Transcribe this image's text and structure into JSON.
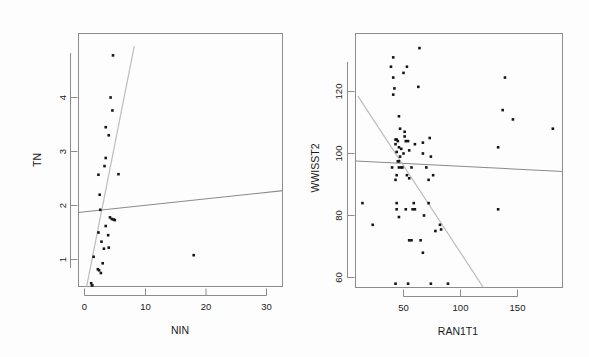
{
  "figure": {
    "title": "",
    "background": "#fdfdfd",
    "point_color": "#161616",
    "axis_color": "#8c8c8c",
    "fit_line_color": "#8a8a8a",
    "steep_line_color": "#bdbdbd"
  },
  "panels": [
    {
      "id": "left",
      "xlabel": "NIN",
      "ylabel": "TN",
      "xticks": [
        "0",
        "10",
        "20",
        "30"
      ],
      "yticks": [
        "1",
        "2",
        "3",
        "4"
      ]
    },
    {
      "id": "right",
      "xlabel": "RAN1T1",
      "ylabel": "WWISST2",
      "xticks": [
        "50",
        "100",
        "150"
      ],
      "yticks": [
        "60",
        "80",
        "100",
        "120"
      ]
    }
  ],
  "chart_data": [
    {
      "type": "scatter",
      "title": "",
      "xlabel": "NIN",
      "ylabel": "TN",
      "xlim": [
        -1.2,
        36.5
      ],
      "ylim": [
        0.3,
        4.95
      ],
      "xticks": [
        0,
        10,
        20,
        30
      ],
      "yticks": [
        1,
        2,
        3,
        4
      ],
      "grid": false,
      "legend": "none",
      "points": [
        {
          "x": 4.7,
          "y": 4.78
        },
        {
          "x": 4.3,
          "y": 4.0
        },
        {
          "x": 4.6,
          "y": 3.76
        },
        {
          "x": 3.5,
          "y": 3.45
        },
        {
          "x": 4.0,
          "y": 3.3
        },
        {
          "x": 3.5,
          "y": 2.88
        },
        {
          "x": 3.3,
          "y": 2.73
        },
        {
          "x": 2.3,
          "y": 2.57
        },
        {
          "x": 5.6,
          "y": 2.58
        },
        {
          "x": 2.5,
          "y": 2.2
        },
        {
          "x": 2.6,
          "y": 1.92
        },
        {
          "x": 34.3,
          "y": 1.97
        },
        {
          "x": 4.5,
          "y": 1.75
        },
        {
          "x": 4.8,
          "y": 1.74
        },
        {
          "x": 5.0,
          "y": 1.73
        },
        {
          "x": 4.2,
          "y": 1.78
        },
        {
          "x": 3.5,
          "y": 1.62
        },
        {
          "x": 2.3,
          "y": 1.5
        },
        {
          "x": 3.9,
          "y": 1.45
        },
        {
          "x": 2.8,
          "y": 1.33
        },
        {
          "x": 4.0,
          "y": 1.22
        },
        {
          "x": 3.2,
          "y": 1.2
        },
        {
          "x": 1.5,
          "y": 1.05
        },
        {
          "x": 18.0,
          "y": 1.08
        },
        {
          "x": 3.0,
          "y": 0.93
        },
        {
          "x": 2.2,
          "y": 0.82
        },
        {
          "x": 2.4,
          "y": 0.8
        },
        {
          "x": 2.7,
          "y": 0.75
        },
        {
          "x": 1.1,
          "y": 0.56
        },
        {
          "x": 1.3,
          "y": 0.52
        },
        {
          "x": 1.2,
          "y": 0.5
        }
      ],
      "lines": [
        {
          "name": "shallow-fit",
          "x1": -1.2,
          "y1": 1.87,
          "x2": 36.5,
          "y2": 2.32,
          "color": "#8a8a8a"
        },
        {
          "name": "steep-fit",
          "x1": 0.0,
          "y1": 0.3,
          "x2": 8.2,
          "y2": 4.95,
          "color": "#bdbdbd"
        }
      ]
    },
    {
      "type": "scatter",
      "title": "",
      "xlabel": "RAN1T1",
      "ylabel": "WWISST2",
      "xlim": [
        8,
        190
      ],
      "ylim": [
        54,
        136
      ],
      "xticks": [
        50,
        100,
        150
      ],
      "yticks": [
        60,
        80,
        100,
        120
      ],
      "grid": false,
      "legend": "none",
      "points": [
        {
          "x": 64,
          "y": 134
        },
        {
          "x": 41,
          "y": 131
        },
        {
          "x": 39,
          "y": 128
        },
        {
          "x": 53,
          "y": 128
        },
        {
          "x": 50,
          "y": 126
        },
        {
          "x": 41,
          "y": 124.5
        },
        {
          "x": 139,
          "y": 124.5
        },
        {
          "x": 63,
          "y": 121.5
        },
        {
          "x": 42,
          "y": 121
        },
        {
          "x": 41,
          "y": 119
        },
        {
          "x": 137,
          "y": 114
        },
        {
          "x": 46,
          "y": 112
        },
        {
          "x": 146,
          "y": 111
        },
        {
          "x": 47,
          "y": 108
        },
        {
          "x": 51,
          "y": 107
        },
        {
          "x": 51,
          "y": 105.5
        },
        {
          "x": 181,
          "y": 108
        },
        {
          "x": 43,
          "y": 104.5
        },
        {
          "x": 44,
          "y": 104.5
        },
        {
          "x": 45,
          "y": 104
        },
        {
          "x": 52,
          "y": 104
        },
        {
          "x": 54,
          "y": 104
        },
        {
          "x": 73,
          "y": 105
        },
        {
          "x": 43,
          "y": 103
        },
        {
          "x": 60,
          "y": 103
        },
        {
          "x": 67,
          "y": 103.5
        },
        {
          "x": 46,
          "y": 102
        },
        {
          "x": 48,
          "y": 101.5
        },
        {
          "x": 133,
          "y": 102
        },
        {
          "x": 44,
          "y": 100.5
        },
        {
          "x": 50,
          "y": 100
        },
        {
          "x": 55,
          "y": 101
        },
        {
          "x": 67,
          "y": 100
        },
        {
          "x": 47,
          "y": 99
        },
        {
          "x": 74,
          "y": 99
        },
        {
          "x": 45,
          "y": 97.5
        },
        {
          "x": 46,
          "y": 97.5
        },
        {
          "x": 40,
          "y": 95.5
        },
        {
          "x": 46,
          "y": 95.5
        },
        {
          "x": 48,
          "y": 95.5
        },
        {
          "x": 49,
          "y": 95.5
        },
        {
          "x": 57,
          "y": 95.5
        },
        {
          "x": 70,
          "y": 95.5
        },
        {
          "x": 44,
          "y": 93
        },
        {
          "x": 53,
          "y": 93
        },
        {
          "x": 76,
          "y": 93
        },
        {
          "x": 43,
          "y": 91.5
        },
        {
          "x": 55,
          "y": 92
        },
        {
          "x": 72,
          "y": 91.5
        },
        {
          "x": 14,
          "y": 84
        },
        {
          "x": 44,
          "y": 84
        },
        {
          "x": 59,
          "y": 84
        },
        {
          "x": 72,
          "y": 84
        },
        {
          "x": 44,
          "y": 82
        },
        {
          "x": 52,
          "y": 82
        },
        {
          "x": 58,
          "y": 82
        },
        {
          "x": 60,
          "y": 82
        },
        {
          "x": 133,
          "y": 82
        },
        {
          "x": 46,
          "y": 79.5
        },
        {
          "x": 68,
          "y": 80
        },
        {
          "x": 23,
          "y": 77
        },
        {
          "x": 82,
          "y": 77
        },
        {
          "x": 78,
          "y": 75
        },
        {
          "x": 83,
          "y": 75.5
        },
        {
          "x": 55,
          "y": 72
        },
        {
          "x": 57,
          "y": 72
        },
        {
          "x": 65,
          "y": 72
        },
        {
          "x": 67,
          "y": 68
        },
        {
          "x": 43,
          "y": 58
        },
        {
          "x": 54,
          "y": 58
        },
        {
          "x": 74,
          "y": 58
        },
        {
          "x": 89,
          "y": 58
        }
      ],
      "lines": [
        {
          "name": "shallow-fit",
          "x1": 8,
          "y1": 97.6,
          "x2": 190,
          "y2": 94.2,
          "color": "#8a8a8a"
        },
        {
          "name": "steep-fit",
          "x1": 10,
          "y1": 118.5,
          "x2": 125,
          "y2": 54,
          "color": "#bdbdbd"
        }
      ]
    }
  ]
}
